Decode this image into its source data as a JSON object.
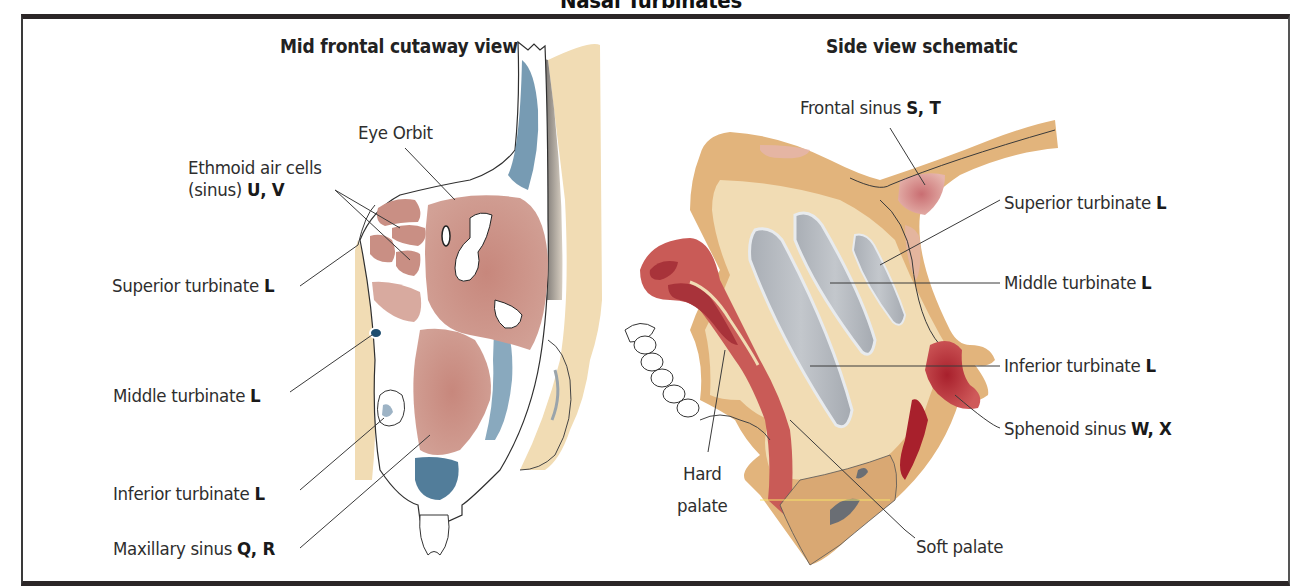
{
  "title": "Nasal Turbinates",
  "colors": {
    "frame": "#2b2627",
    "tissue_tan": "#f1dcb4",
    "bone_tan": "#e2b47c",
    "sinus_pink": "#c98f84",
    "mucosa_red": "#b9484a",
    "sphenoid_red": "#b3303a",
    "blue_shading": "#3f6f8f",
    "turbinate_gray": "#b7bcc2"
  },
  "left_panel": {
    "title": "Mid frontal cutaway view",
    "labels": {
      "eye_orbit": {
        "text": "Eye Orbit"
      },
      "ethmoid": {
        "line1": "Ethmoid air cells",
        "line2_text": "(sinus) ",
        "line2_code": "U, V"
      },
      "superior_turbinate": {
        "text": "Superior turbinate ",
        "code": "L"
      },
      "middle_turbinate": {
        "text": "Middle turbinate ",
        "code": "L"
      },
      "inferior_turbinate": {
        "text": "Inferior turbinate ",
        "code": "L"
      },
      "maxillary_sinus": {
        "text": "Maxillary sinus ",
        "code": "Q, R"
      }
    }
  },
  "right_panel": {
    "title": "Side view schematic",
    "labels": {
      "frontal_sinus": {
        "text": "Frontal sinus ",
        "code": "S, T"
      },
      "superior_turbinate": {
        "text": "Superior turbinate ",
        "code": "L"
      },
      "middle_turbinate": {
        "text": "Middle turbinate ",
        "code": "L"
      },
      "inferior_turbinate": {
        "text": "Inferior turbinate ",
        "code": "L"
      },
      "sphenoid_sinus": {
        "text": "Sphenoid sinus ",
        "code": "W, X"
      },
      "hard_palate": {
        "line1": "Hard",
        "line2": "palate"
      },
      "soft_palate": {
        "text": "Soft palate"
      }
    }
  }
}
